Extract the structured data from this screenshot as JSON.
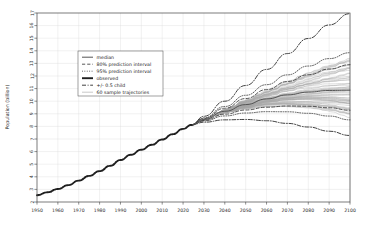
{
  "chart_data": {
    "type": "line",
    "title": "",
    "xlabel": "",
    "ylabel": "Population (billion)",
    "xlim": [
      1950,
      2100
    ],
    "ylim": [
      2,
      17
    ],
    "grid": true,
    "legend_position": "upper-left-inside",
    "x_ticks": [
      1950,
      1960,
      1970,
      1980,
      1990,
      2000,
      2010,
      2020,
      2030,
      2040,
      2050,
      2060,
      2070,
      2080,
      2090,
      2100
    ],
    "y_ticks": [
      2,
      3,
      4,
      5,
      6,
      7,
      8,
      9,
      10,
      11,
      12,
      13,
      14,
      15,
      16,
      17
    ],
    "legend": [
      {
        "label": "median",
        "style": "solid",
        "color": "#555555",
        "width": 1.0
      },
      {
        "label": "80% prediction interval",
        "style": "dashed",
        "color": "#444444",
        "width": 0.9
      },
      {
        "label": "95% prediction interval",
        "style": "dotted",
        "color": "#444444",
        "width": 0.9
      },
      {
        "label": "observed",
        "style": "solid-thick",
        "color": "#222222",
        "width": 2.0
      },
      {
        "label": "+/- 0.5 child",
        "style": "dashdot",
        "color": "#222222",
        "width": 0.9
      },
      {
        "label": "60 sample trajectories",
        "style": "solid-light",
        "color": "#999999",
        "width": 0.6
      }
    ],
    "series": [
      {
        "name": "observed",
        "style": "solid-thick",
        "x": [
          1950,
          1955,
          1960,
          1965,
          1970,
          1975,
          1980,
          1985,
          1990,
          1995,
          2000,
          2005,
          2010,
          2015,
          2020,
          2024
        ],
        "values": [
          2.54,
          2.77,
          3.03,
          3.34,
          3.7,
          4.07,
          4.45,
          4.87,
          5.33,
          5.75,
          6.15,
          6.54,
          6.96,
          7.38,
          7.8,
          8.12
        ]
      },
      {
        "name": "median",
        "style": "solid",
        "x": [
          2024,
          2030,
          2040,
          2050,
          2060,
          2070,
          2080,
          2090,
          2100
        ],
        "values": [
          8.12,
          8.55,
          9.2,
          9.73,
          10.18,
          10.5,
          10.72,
          10.85,
          10.88
        ]
      },
      {
        "name": "80% prediction interval upper",
        "style": "dashed",
        "x": [
          2024,
          2030,
          2040,
          2050,
          2060,
          2070,
          2080,
          2090,
          2100
        ],
        "values": [
          8.12,
          8.63,
          9.44,
          10.21,
          10.92,
          11.56,
          12.1,
          12.55,
          12.9
        ]
      },
      {
        "name": "80% prediction interval lower",
        "style": "dashed",
        "x": [
          2024,
          2030,
          2040,
          2050,
          2060,
          2070,
          2080,
          2090,
          2100
        ],
        "values": [
          8.12,
          8.47,
          8.97,
          9.3,
          9.52,
          9.62,
          9.6,
          9.48,
          9.28
        ]
      },
      {
        "name": "95% prediction interval upper",
        "style": "dotted",
        "x": [
          2024,
          2030,
          2040,
          2050,
          2060,
          2070,
          2080,
          2090,
          2100
        ],
        "values": [
          8.12,
          8.68,
          9.58,
          10.47,
          11.31,
          12.09,
          12.79,
          13.38,
          13.85
        ]
      },
      {
        "name": "95% prediction interval lower",
        "style": "dotted",
        "x": [
          2024,
          2030,
          2040,
          2050,
          2060,
          2070,
          2080,
          2090,
          2100
        ],
        "values": [
          8.12,
          8.43,
          8.83,
          9.06,
          9.17,
          9.16,
          9.04,
          8.82,
          8.52
        ]
      },
      {
        "name": "+0.5 child",
        "style": "dashdot",
        "x": [
          2024,
          2030,
          2040,
          2050,
          2060,
          2070,
          2080,
          2090,
          2100
        ],
        "values": [
          8.12,
          8.8,
          10.0,
          11.25,
          12.52,
          13.78,
          14.98,
          16.05,
          16.95
        ]
      },
      {
        "name": "-0.5 child",
        "style": "dashdot",
        "x": [
          2024,
          2030,
          2040,
          2050,
          2060,
          2070,
          2080,
          2090,
          2100
        ],
        "values": [
          8.12,
          8.33,
          8.52,
          8.55,
          8.45,
          8.24,
          7.95,
          7.62,
          7.28
        ]
      }
    ],
    "sample_trajectories_count": 60,
    "sample_trajectory_spread_at_2100": [
      9.3,
      12.9
    ]
  },
  "axes": {
    "y_title": "Population (billion)"
  }
}
